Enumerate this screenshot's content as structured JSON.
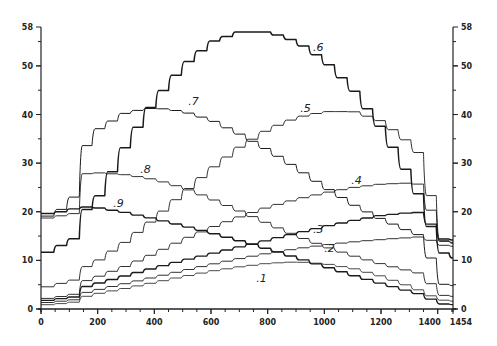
{
  "chart_data": {
    "type": "line",
    "title": "",
    "xlabel": "",
    "ylabel": "",
    "xlim": [
      0,
      1454
    ],
    "ylim": [
      0,
      58
    ],
    "grid": false,
    "legend": "inline curve labels",
    "x_ticks": [
      0,
      200,
      400,
      600,
      800,
      1000,
      1200,
      1400,
      1454
    ],
    "x_tick_labels": [
      "0",
      "200",
      "400",
      "600",
      "800",
      "1000",
      "1200",
      "1400",
      "1454"
    ],
    "y_ticks": [
      0,
      10,
      20,
      30,
      40,
      50,
      58
    ],
    "y_tick_labels": [
      "0",
      "10",
      "20",
      "30",
      "40",
      "50",
      "58"
    ],
    "right_axis_ticks": [
      0,
      10,
      20,
      30,
      40,
      50,
      58
    ],
    "x": [
      0,
      50,
      130,
      150,
      200,
      300,
      400,
      500,
      600,
      700,
      800,
      900,
      1000,
      1100,
      1200,
      1300,
      1350,
      1400,
      1454
    ],
    "series": [
      {
        "name": ".1",
        "label": ".1",
        "values": [
          0.8,
          1.0,
          1.5,
          2.5,
          3.2,
          4.3,
          5.5,
          6.7,
          7.8,
          8.7,
          9.4,
          9.7,
          9.3,
          8.3,
          6.7,
          4.6,
          3.4,
          1.9,
          1.6
        ]
      },
      {
        "name": ".2",
        "label": ".2",
        "values": [
          1.2,
          1.5,
          2.0,
          3.3,
          4.0,
          5.3,
          6.6,
          7.9,
          9.2,
          10.4,
          11.5,
          12.4,
          13.2,
          13.8,
          14.3,
          14.7,
          14.9,
          13.2,
          12.9
        ]
      },
      {
        "name": ".3",
        "label": ".3",
        "values": [
          1.6,
          2.0,
          2.6,
          4.5,
          5.3,
          6.9,
          8.5,
          10.0,
          11.4,
          12.8,
          14.2,
          15.6,
          17.0,
          18.2,
          19.3,
          19.8,
          19.9,
          14.5,
          14.2
        ]
      },
      {
        "name": ".4",
        "label": ".4",
        "values": [
          2.0,
          2.4,
          3.2,
          5.7,
          6.7,
          8.9,
          11.5,
          14.3,
          16.8,
          19.0,
          21.0,
          22.6,
          23.9,
          25.0,
          25.7,
          25.9,
          25.5,
          14.0,
          13.7
        ]
      },
      {
        "name": ".5",
        "label": ".5",
        "values": [
          4.2,
          5.0,
          6.2,
          8.5,
          10.0,
          14.0,
          18.7,
          23.9,
          28.9,
          33.4,
          37.0,
          39.4,
          40.6,
          40.6,
          38.6,
          34.0,
          30.7,
          14.3,
          13.5
        ]
      },
      {
        "name": ".6",
        "label": ".6",
        "values": [
          11.0,
          12.5,
          15.0,
          20.0,
          23.0,
          34.0,
          43.0,
          50.0,
          55.0,
          57.0,
          57.0,
          55.0,
          51.0,
          45.0,
          37.0,
          27.0,
          21.0,
          12.0,
          10.5
        ]
      },
      {
        "name": ".7",
        "label": ".7",
        "values": [
          18.8,
          19.5,
          24.0,
          33.0,
          37.0,
          40.5,
          41.4,
          40.6,
          38.8,
          35.9,
          32.6,
          28.9,
          25.0,
          21.4,
          18.4,
          15.9,
          14.8,
          5.2,
          4.8
        ]
      },
      {
        "name": ".8",
        "label": ".8",
        "values": [
          18.5,
          19.0,
          19.8,
          27.8,
          28.0,
          27.6,
          26.6,
          24.9,
          22.6,
          20.1,
          17.5,
          15.0,
          12.8,
          10.9,
          9.2,
          7.8,
          7.1,
          2.9,
          2.6
        ]
      },
      {
        "name": ".9",
        "label": ".9",
        "values": [
          19.5,
          19.8,
          20.8,
          21.0,
          20.8,
          19.8,
          18.5,
          17.1,
          15.6,
          14.0,
          12.3,
          10.5,
          8.7,
          6.9,
          5.2,
          3.6,
          2.8,
          1.1,
          0.9
        ]
      }
    ],
    "annotations": [
      {
        "text": ".1",
        "x": 760,
        "y": 5.5
      },
      {
        "text": ".2",
        "x": 1000,
        "y": 11.7
      },
      {
        "text": ".3",
        "x": 960,
        "y": 15.6
      },
      {
        "text": ".4",
        "x": 1095,
        "y": 25.8
      },
      {
        "text": ".5",
        "x": 915,
        "y": 40.5
      },
      {
        "text": ".6",
        "x": 960,
        "y": 53.0
      },
      {
        "text": ".7",
        "x": 520,
        "y": 42.0
      },
      {
        "text": ".8",
        "x": 350,
        "y": 28.0
      },
      {
        "text": ".9",
        "x": 255,
        "y": 21.0
      }
    ]
  },
  "plot": {
    "px": {
      "left": 41,
      "right": 453,
      "top": 27,
      "bottom": 309
    }
  }
}
